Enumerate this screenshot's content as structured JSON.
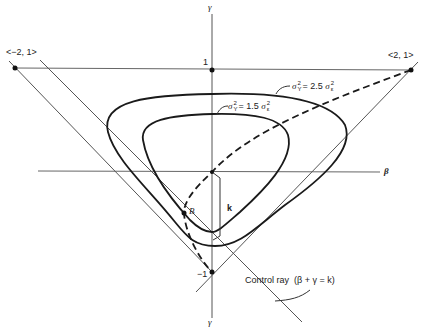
{
  "diagram": {
    "axes": {
      "vertical_top_label": "γ",
      "vertical_bottom_label": "γ",
      "horizontal_label": "β",
      "tick_1": "1",
      "tick_minus1": "−1"
    },
    "points": {
      "left_corner": "<−2, 1>",
      "right_corner": "<2, 1>",
      "B": "B"
    },
    "contours": [
      {
        "sigma": "σ",
        "sup": "2",
        "sub": "Y",
        "eq": "= 2.5",
        "rhs_sigma": "σ",
        "rhs_sup": "2",
        "rhs_sub": "ε"
      },
      {
        "sigma": "σ",
        "sup": "2",
        "sub": "Y",
        "eq": "= 1.5",
        "rhs_sigma": "σ",
        "rhs_sup": "2",
        "rhs_sub": "ε"
      }
    ],
    "k_label": "k",
    "control_ray": {
      "label_prefix": "Control ray",
      "label_formula": "(β + γ = k)"
    },
    "colors": {
      "line": "#555555",
      "curve": "#1a1a1a",
      "text": "#222222"
    }
  }
}
